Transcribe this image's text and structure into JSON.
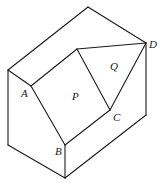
{
  "diagram": {
    "type": "isometric-solid",
    "vertices": {
      "top": [
        88,
        7
      ],
      "left_top": [
        8,
        70
      ],
      "A": [
        31,
        86
      ],
      "P_top": [
        77,
        49
      ],
      "D": [
        146,
        43
      ],
      "C": [
        110,
        110
      ],
      "B": [
        65,
        145
      ],
      "bottom": [
        65,
        178
      ],
      "left_bottom": [
        8,
        145
      ],
      "right_bottom": [
        146,
        115
      ]
    },
    "labels": {
      "A": "A",
      "B": "B",
      "C": "C",
      "D": "D",
      "P": "P",
      "Q": "Q"
    },
    "faces": [
      {
        "name": "P",
        "label": "P",
        "vertices": [
          "A",
          "P_top",
          "C",
          "B"
        ]
      },
      {
        "name": "Q",
        "label": "Q",
        "vertices": [
          "P_top",
          "D",
          "C"
        ]
      }
    ],
    "stroke_color": "#1a1a1a",
    "background": "#ffffff"
  }
}
